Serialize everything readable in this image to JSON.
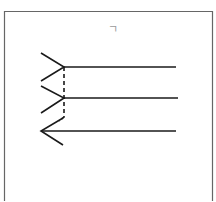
{
  "figure": {
    "type": "muller-lyer-style illusion",
    "annotation_mark": "ㄱ",
    "colors": {
      "background": "#ffffff",
      "frame": "#666666",
      "lines": "#1a1a1a",
      "mark": "#9a9a9a"
    },
    "lines": [
      {
        "name": "top-line",
        "x1": 64,
        "y1": 67,
        "x2": 176,
        "y2": 67,
        "ends": "fins-out-left"
      },
      {
        "name": "middle-line",
        "x1": 64,
        "y1": 98,
        "x2": 178,
        "y2": 98,
        "ends": "fins-out-left"
      },
      {
        "name": "bottom-line",
        "x1": 41,
        "y1": 131,
        "x2": 176,
        "y2": 131,
        "ends": "arrowhead-left"
      }
    ],
    "dashed_connector": {
      "x": 64,
      "y1": 67,
      "y2": 117
    }
  }
}
